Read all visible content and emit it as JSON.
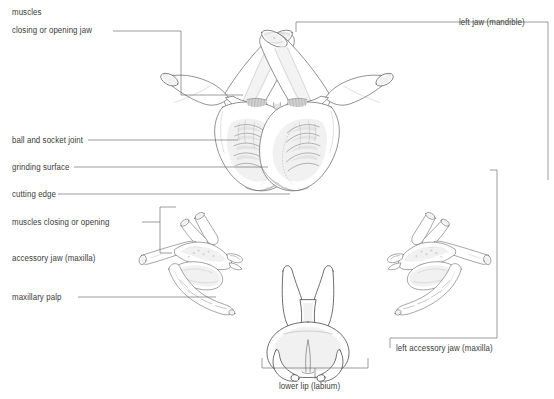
{
  "figure": {
    "background": "#ffffff",
    "ink": "#4a4a4a",
    "text_color": "#3a3a3a",
    "shade_light": "#f2f2f2",
    "shade_mid": "#e2e2e2",
    "shade_dark": "#c9c9c9"
  },
  "labels": {
    "muscles_jaw_line1": "muscles",
    "muscles_jaw_line2": "closing or opening jaw",
    "ball_and_socket": "ball and socket joint",
    "grinding_surface": "grinding surface",
    "cutting_edge": "cutting edge",
    "muscles_maxilla": "muscles closing or opening",
    "accessory_jaw": "accessory jaw (maxilla)",
    "maxillary_palp": "maxillary palp",
    "left_jaw": "left jaw (mandible)",
    "left_accessory_jaw": "left accessory jaw (maxilla)",
    "lower_lip": "lower lip (labium)"
  }
}
